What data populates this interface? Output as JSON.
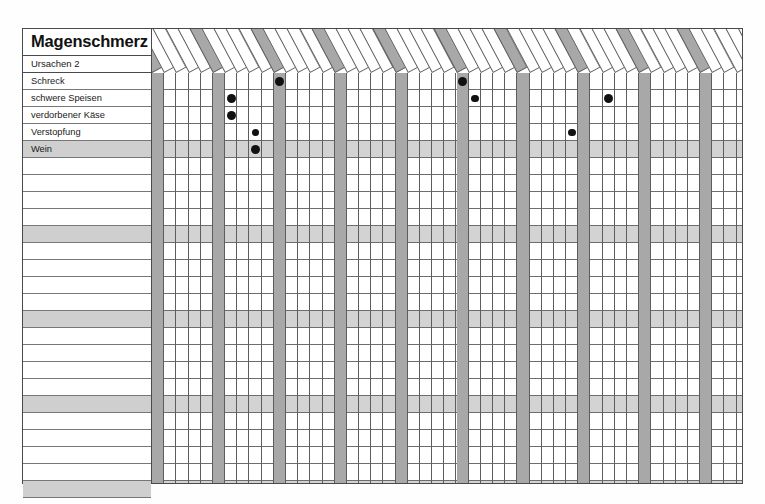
{
  "sheet": {
    "title": "Magenschmerz",
    "subtitle": "Ursachen 2"
  },
  "colors": {
    "grid_line": "#5d5d5d",
    "shaded_column": "#a8a8a8",
    "shaded_row": "#cfcfcf",
    "dot": "#111111",
    "frame": "#4a4a4a",
    "paper": "#ffffff"
  },
  "rows": [
    {
      "label": "Schreck"
    },
    {
      "label": "schwere Speisen"
    },
    {
      "label": "verdorbener Käse"
    },
    {
      "label": "Verstopfung"
    },
    {
      "label": "Wein",
      "shaded": true
    },
    {
      "label": ""
    },
    {
      "label": ""
    },
    {
      "label": ""
    },
    {
      "label": ""
    },
    {
      "label": "",
      "shaded": true
    },
    {
      "label": ""
    },
    {
      "label": ""
    },
    {
      "label": ""
    },
    {
      "label": ""
    },
    {
      "label": "",
      "shaded": true
    },
    {
      "label": ""
    },
    {
      "label": ""
    },
    {
      "label": ""
    },
    {
      "label": ""
    },
    {
      "label": "",
      "shaded": true
    },
    {
      "label": ""
    },
    {
      "label": ""
    },
    {
      "label": ""
    },
    {
      "label": ""
    },
    {
      "label": "",
      "shaded": true
    }
  ],
  "columns": [
    {
      "label": "Acon.",
      "shaded": true
    },
    {
      "label": "All. c.",
      "shaded": false
    },
    {
      "label": "Ant. t.",
      "shaded": false
    },
    {
      "label": "Apis",
      "shaded": false
    },
    {
      "label": "Arn.",
      "shaded": false
    },
    {
      "label": "Ars.",
      "shaded": true
    },
    {
      "label": "Bell.",
      "shaded": false
    },
    {
      "label": "Bry.",
      "shaded": false
    },
    {
      "label": "Calend.",
      "shaded": false
    },
    {
      "label": "Canth.",
      "shaded": false
    },
    {
      "label": "Carb. v.",
      "shaded": true
    },
    {
      "label": "Caust.",
      "shaded": false
    },
    {
      "label": "Cham.",
      "shaded": false
    },
    {
      "label": "Chin.",
      "shaded": false
    },
    {
      "label": "Cocc.",
      "shaded": false
    },
    {
      "label": "Coff.",
      "shaded": true
    },
    {
      "label": "Coloc.",
      "shaded": false
    },
    {
      "label": "Dros.",
      "shaded": false
    },
    {
      "label": "Dulc.",
      "shaded": false
    },
    {
      "label": "Eup. per.",
      "shaded": false
    },
    {
      "label": "Ferr. p.",
      "shaded": true
    },
    {
      "label": "Gels.",
      "shaded": false
    },
    {
      "label": "Glon.",
      "shaded": false
    },
    {
      "label": "Hep.",
      "shaded": false
    },
    {
      "label": "Hyper.",
      "shaded": false
    },
    {
      "label": "Ign.",
      "shaded": true
    },
    {
      "label": "Ipec.",
      "shaded": false
    },
    {
      "label": "Kal. c.",
      "shaded": false
    },
    {
      "label": "Kal. bi.",
      "shaded": false
    },
    {
      "label": "Lach.",
      "shaded": false
    },
    {
      "label": "Led.",
      "shaded": true
    },
    {
      "label": "Mag. p.",
      "shaded": false
    },
    {
      "label": "Merc.",
      "shaded": false
    },
    {
      "label": "Nat. m.",
      "shaded": false
    },
    {
      "label": "Nux v.",
      "shaded": false
    },
    {
      "label": "Phos.",
      "shaded": true
    },
    {
      "label": "Phyt.",
      "shaded": false
    },
    {
      "label": "Puls.",
      "shaded": false
    },
    {
      "label": "Pyrog.",
      "shaded": false
    },
    {
      "label": "Rhus t.",
      "shaded": false
    },
    {
      "label": "Ruta",
      "shaded": true
    },
    {
      "label": "Samb.",
      "shaded": false
    },
    {
      "label": "Sec.",
      "shaded": false
    },
    {
      "label": "Sep.",
      "shaded": false
    },
    {
      "label": "Sil.",
      "shaded": false
    },
    {
      "label": "Spong.",
      "shaded": true
    },
    {
      "label": "Staph.",
      "shaded": false
    },
    {
      "label": "Sulf.",
      "shaded": false
    },
    {
      "label": "Symph.",
      "shaded": false
    },
    {
      "label": "Verat.",
      "shaded": false
    }
  ],
  "marks": [
    {
      "row": "Schreck",
      "column": "Carb. v.",
      "size": "large"
    },
    {
      "row": "Schreck",
      "column": "Ign.",
      "size": "large"
    },
    {
      "row": "schwere Speisen",
      "column": "Bell.",
      "size": "large"
    },
    {
      "row": "schwere Speisen",
      "column": "Ipec.",
      "size": "small"
    },
    {
      "row": "schwere Speisen",
      "column": "Puls.",
      "size": "large"
    },
    {
      "row": "verdorbener Käse",
      "column": "Bell.",
      "size": "large"
    },
    {
      "row": "Verstopfung",
      "column": "Calend.",
      "size": "small"
    },
    {
      "row": "Verstopfung",
      "column": "Nux v.",
      "size": "small"
    },
    {
      "row": "Wein",
      "column": "Calend.",
      "size": "large"
    }
  ]
}
